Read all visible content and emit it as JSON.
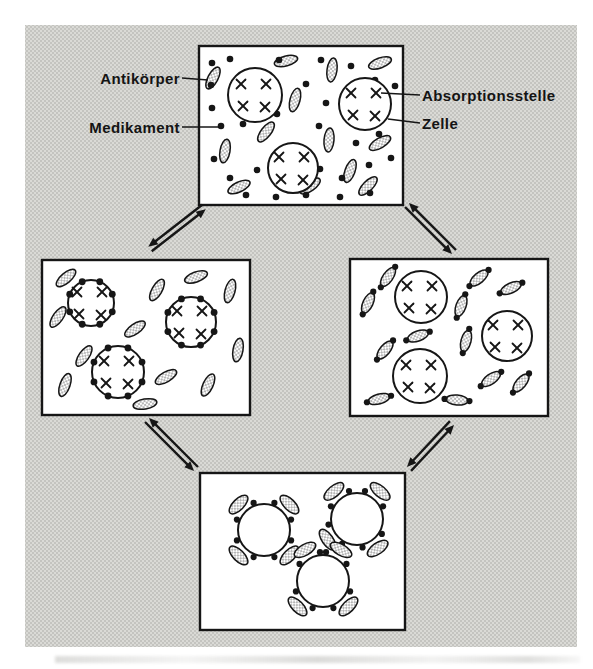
{
  "figure": {
    "ink": "#161616",
    "panel_fill": "#ffffff",
    "stage_tone": "#c9c9c5",
    "labels": {
      "antikoerper": "Antikörper",
      "medikament": "Medikament",
      "absorptionsstelle": "Absorptionsstelle",
      "zelle": "Zelle"
    },
    "legend": {
      "stippled_ellipse": "Antikörper",
      "black_dot": "Medikament",
      "x_mark": "Absorptionsstelle",
      "open_circle": "Zelle"
    }
  },
  "diagram": {
    "stage": {
      "x": 25,
      "y": 25,
      "w": 552,
      "h": 622
    },
    "panels": [
      {
        "name": "initial-mixture",
        "x": 199,
        "y": 46,
        "w": 204,
        "h": 159,
        "cells": [
          {
            "x": 56,
            "y": 49,
            "r": 27,
            "marks": true
          },
          {
            "x": 166,
            "y": 58,
            "r": 26,
            "marks": true
          },
          {
            "x": 94,
            "y": 122,
            "r": 25,
            "marks": true
          }
        ],
        "ellipses": [
          [
            14,
            32,
            -62
          ],
          [
            87,
            15,
            -15
          ],
          [
            133,
            24,
            -82
          ],
          [
            96,
            54,
            -75
          ],
          [
            67,
            86,
            -52
          ],
          [
            26,
            105,
            -80
          ],
          [
            40,
            141,
            -25
          ],
          [
            130,
            94,
            -85
          ],
          [
            151,
            125,
            -70
          ],
          [
            181,
            17,
            -20
          ],
          [
            181,
            97,
            -30
          ],
          [
            111,
            140,
            -35
          ],
          [
            169,
            140,
            -45
          ]
        ],
        "dots": [
          [
            13,
            17
          ],
          [
            31,
            13
          ],
          [
            12,
            39
          ],
          [
            22,
            80
          ],
          [
            13,
            62
          ],
          [
            44,
            78
          ],
          [
            78,
            68
          ],
          [
            80,
            14
          ],
          [
            122,
            14
          ],
          [
            107,
            38
          ],
          [
            127,
            57
          ],
          [
            152,
            20
          ],
          [
            176,
            34
          ],
          [
            196,
            40
          ],
          [
            120,
            80
          ],
          [
            157,
            97
          ],
          [
            180,
            88
          ],
          [
            15,
            113
          ],
          [
            31,
            132
          ],
          [
            58,
            124
          ],
          [
            88,
            137
          ],
          [
            121,
            123
          ],
          [
            143,
            132
          ],
          [
            170,
            119
          ],
          [
            192,
            112
          ],
          [
            47,
            149
          ],
          [
            77,
            151
          ],
          [
            107,
            149
          ],
          [
            141,
            151
          ],
          [
            171,
            147
          ]
        ]
      },
      {
        "name": "drug-bound-to-cells",
        "x": 42,
        "y": 260,
        "w": 208,
        "h": 155,
        "cells": [
          {
            "x": 49,
            "y": 43,
            "r": 23,
            "marks": true,
            "rim_dots": 8
          },
          {
            "x": 149,
            "y": 62,
            "r": 25,
            "marks": true,
            "rim_dots": 8
          },
          {
            "x": 76,
            "y": 112,
            "r": 26,
            "marks": true,
            "rim_dots": 8
          }
        ],
        "ellipses": [
          [
            24,
            18,
            -40
          ],
          [
            115,
            30,
            -60
          ],
          [
            154,
            17,
            -20
          ],
          [
            188,
            31,
            -75
          ],
          [
            16,
            57,
            -55
          ],
          [
            93,
            69,
            -35
          ],
          [
            42,
            96,
            -55
          ],
          [
            23,
            125,
            -70
          ],
          [
            124,
            117,
            -30
          ],
          [
            166,
            125,
            -65
          ],
          [
            103,
            144,
            -10
          ],
          [
            196,
            90,
            -80
          ]
        ],
        "dots": []
      },
      {
        "name": "drug-antibody-complexes",
        "x": 350,
        "y": 259,
        "w": 198,
        "h": 157,
        "cells": [
          {
            "x": 71,
            "y": 38,
            "r": 26,
            "marks": true
          },
          {
            "x": 157,
            "y": 77,
            "r": 25,
            "marks": true
          },
          {
            "x": 70,
            "y": 117,
            "r": 27,
            "marks": true
          }
        ],
        "complexes": [
          [
            38,
            18,
            -55
          ],
          [
            18,
            44,
            -65
          ],
          [
            129,
            19,
            -40
          ],
          [
            161,
            29,
            -25
          ],
          [
            111,
            47,
            -70
          ],
          [
            68,
            77,
            -20
          ],
          [
            35,
            91,
            -50
          ],
          [
            116,
            82,
            -75
          ],
          [
            141,
            120,
            -35
          ],
          [
            171,
            124,
            -50
          ],
          [
            29,
            140,
            -15
          ],
          [
            107,
            141,
            5
          ]
        ]
      },
      {
        "name": "agglutination",
        "x": 200,
        "y": 473,
        "w": 205,
        "h": 157,
        "cells": [
          {
            "x": 64,
            "y": 57,
            "r": 26,
            "marks": false,
            "attachments": [
              -135,
              -45,
              45,
              135
            ]
          },
          {
            "x": 157,
            "y": 46,
            "r": 26,
            "marks": false,
            "attachments": [
              -130,
              -50,
              55,
              145
            ]
          },
          {
            "x": 123,
            "y": 108,
            "r": 26,
            "marks": false,
            "attachments": [
              -120,
              -60,
              45,
              135
            ]
          }
        ]
      }
    ],
    "pointer_lines": [
      {
        "x1": 182,
        "y1": 78,
        "x2": 208,
        "y2": 80
      },
      {
        "x1": 182,
        "y1": 127,
        "x2": 219,
        "y2": 127
      },
      {
        "x1": 420,
        "y1": 95,
        "x2": 381,
        "y2": 93
      },
      {
        "x1": 420,
        "y1": 123,
        "x2": 388,
        "y2": 119
      }
    ],
    "equilibrium_arrows": [
      {
        "x1": 150,
        "y1": 249,
        "x2": 204,
        "y2": 207
      },
      {
        "x1": 454,
        "y1": 252,
        "x2": 407,
        "y2": 205
      },
      {
        "x1": 196,
        "y1": 469,
        "x2": 147,
        "y2": 420
      },
      {
        "x1": 409,
        "y1": 469,
        "x2": 452,
        "y2": 423
      }
    ]
  }
}
